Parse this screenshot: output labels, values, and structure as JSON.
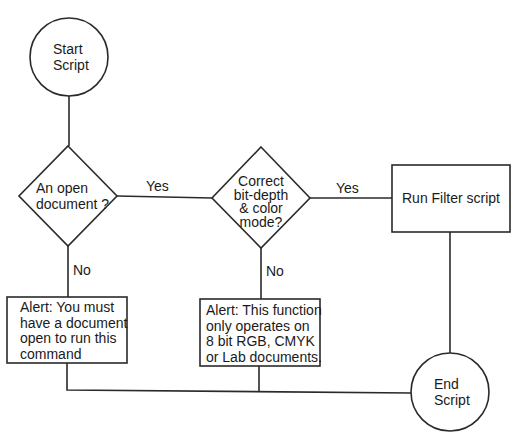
{
  "diagram": {
    "type": "flowchart",
    "line_color": "#2a2a2a",
    "background": "#ffffff",
    "nodes": {
      "start": {
        "shape": "circle",
        "label_lines": [
          "Start",
          "Script"
        ]
      },
      "decision_open_doc": {
        "shape": "diamond",
        "label_lines": [
          "An open",
          "document ?"
        ]
      },
      "decision_bit_depth": {
        "shape": "diamond",
        "label_lines": [
          "Correct",
          "bit-depth",
          "& color",
          "mode?"
        ]
      },
      "run_filter": {
        "shape": "rectangle",
        "label": "Run Filter script"
      },
      "alert_no_doc": {
        "shape": "rectangle",
        "label_lines": [
          "Alert: You must",
          "have a document",
          "open to run this",
          "command"
        ]
      },
      "alert_bad_mode": {
        "shape": "rectangle",
        "label_lines": [
          "Alert: This function",
          "only operates on",
          "8 bit RGB, CMYK",
          "or Lab documents."
        ]
      },
      "end": {
        "shape": "circle",
        "label_lines": [
          "End",
          "Script"
        ]
      }
    },
    "edges": [
      {
        "from": "start",
        "to": "decision_open_doc",
        "label": ""
      },
      {
        "from": "decision_open_doc",
        "to": "decision_bit_depth",
        "label": "Yes"
      },
      {
        "from": "decision_open_doc",
        "to": "alert_no_doc",
        "label": "No"
      },
      {
        "from": "decision_bit_depth",
        "to": "run_filter",
        "label": "Yes"
      },
      {
        "from": "decision_bit_depth",
        "to": "alert_bad_mode",
        "label": "No"
      },
      {
        "from": "run_filter",
        "to": "end",
        "label": ""
      },
      {
        "from": "alert_no_doc",
        "to": "end",
        "label": ""
      },
      {
        "from": "alert_bad_mode",
        "to": "end",
        "label": ""
      }
    ],
    "edge_labels": {
      "yes_1": "Yes",
      "no_1": "No",
      "yes_2": "Yes",
      "no_2": "No"
    }
  }
}
